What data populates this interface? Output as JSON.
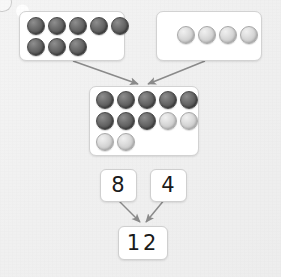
{
  "scene": {
    "title": "Addition counters part-part-whole model",
    "background_color": "#f1f1f1",
    "counter_dark_color": "#5d5d5d",
    "counter_light_color": "#d2d2d2",
    "box_fill": "#ffffff",
    "box_border": "#d2d2d2",
    "arrow_color": "#8a8a8a",
    "text_color": "#1a1a1a"
  },
  "groups": [
    {
      "id": "addend-group-1",
      "name": "first-addend-counters",
      "count": 8,
      "rows": [
        [
          "dark",
          "dark",
          "dark",
          "dark",
          "dark"
        ],
        [
          "dark",
          "dark",
          "dark"
        ]
      ]
    },
    {
      "id": "addend-group-2",
      "name": "second-addend-counters",
      "count": 4,
      "rows": [
        [
          "light",
          "light",
          "light",
          "light"
        ]
      ]
    },
    {
      "id": "sum-group",
      "name": "combined-counters",
      "count": 12,
      "rows": [
        [
          "dark",
          "dark",
          "dark",
          "dark",
          "dark"
        ],
        [
          "dark",
          "dark",
          "dark",
          "light",
          "light"
        ],
        [
          "light",
          "light"
        ]
      ]
    }
  ],
  "numbers": {
    "addend_one": "8",
    "addend_two": "4",
    "sum": "12"
  },
  "arrows": [
    {
      "name": "arrow-group1-to-sum",
      "from": "addend-group-1",
      "to": "sum-group"
    },
    {
      "name": "arrow-group2-to-sum",
      "from": "addend-group-2",
      "to": "sum-group"
    },
    {
      "name": "arrow-eight-to-sum",
      "from": "addend_one",
      "to": "sum"
    },
    {
      "name": "arrow-four-to-sum",
      "from": "addend_two",
      "to": "sum"
    }
  ]
}
